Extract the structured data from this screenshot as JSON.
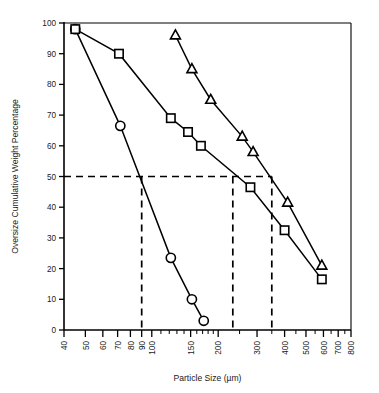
{
  "chart_data": {
    "type": "line",
    "title": "",
    "xlabel": "Particle Size (µm)",
    "ylabel": "Oversize Cumulative Weight Percentage",
    "xscale": "log",
    "yscale": "linear",
    "xlim": [
      40,
      800
    ],
    "ylim": [
      0,
      100
    ],
    "grid": false,
    "legend": "none",
    "x_tick_labels": [
      "40",
      "50",
      "60",
      "70",
      "80",
      "90",
      "100",
      "150",
      "200",
      "300",
      "400",
      "500",
      "600",
      "700",
      "800"
    ],
    "x_tick_values": [
      40,
      50,
      60,
      70,
      80,
      90,
      100,
      150,
      200,
      300,
      400,
      500,
      600,
      700,
      800
    ],
    "y_tick_labels": [
      "0",
      "10",
      "20",
      "30",
      "40",
      "50",
      "60",
      "70",
      "80",
      "90",
      "100"
    ],
    "y_tick_values": [
      0,
      10,
      20,
      30,
      40,
      50,
      60,
      70,
      80,
      90,
      100
    ],
    "series": [
      {
        "name": "circle-series",
        "marker": "circle",
        "points": [
          {
            "x": 45,
            "y": 98
          },
          {
            "x": 72,
            "y": 66.5
          },
          {
            "x": 122,
            "y": 23.5
          },
          {
            "x": 152,
            "y": 10
          },
          {
            "x": 172,
            "y": 3
          }
        ],
        "median_x": 90
      },
      {
        "name": "square-series",
        "marker": "square",
        "points": [
          {
            "x": 45,
            "y": 98
          },
          {
            "x": 71,
            "y": 90
          },
          {
            "x": 122,
            "y": 69
          },
          {
            "x": 146,
            "y": 64.5
          },
          {
            "x": 167,
            "y": 60
          },
          {
            "x": 280,
            "y": 46.5
          },
          {
            "x": 400,
            "y": 32.5
          },
          {
            "x": 590,
            "y": 16.5
          }
        ],
        "median_x": 233
      },
      {
        "name": "triangle-series",
        "marker": "triangle",
        "points": [
          {
            "x": 128,
            "y": 96
          },
          {
            "x": 152,
            "y": 85
          },
          {
            "x": 185,
            "y": 75
          },
          {
            "x": 257,
            "y": 63
          },
          {
            "x": 288,
            "y": 58
          },
          {
            "x": 413,
            "y": 41.5
          },
          {
            "x": 590,
            "y": 21
          }
        ],
        "median_x": 350
      }
    ],
    "guide_lines": {
      "horizontal_y": 50,
      "vertical_x": [
        90,
        233,
        350
      ],
      "style": "dashed"
    },
    "annotations": []
  }
}
